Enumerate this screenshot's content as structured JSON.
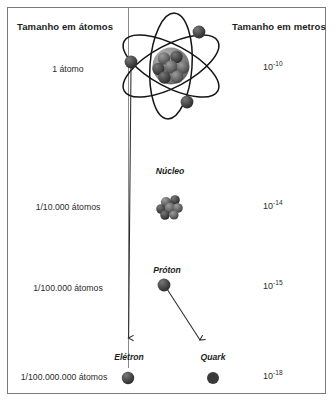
{
  "figure": {
    "title_left": "Tamanho em átomos",
    "title_right": "Tamanho em metros"
  },
  "rows": [
    {
      "atoms_label": "1 átomo",
      "meters_mantissa": "10",
      "meters_exponent": "-10",
      "part_label": "",
      "illustration": "atom-diagram"
    },
    {
      "atoms_label": "1/10.000 átomos",
      "meters_mantissa": "10",
      "meters_exponent": "-14",
      "part_label": "Núcleo",
      "illustration": "nucleus-cluster"
    },
    {
      "atoms_label": "1/100.000 átomos",
      "meters_mantissa": "10",
      "meters_exponent": "-15",
      "part_label": "Próton",
      "illustration": "proton-sphere"
    },
    {
      "atoms_label": "1/100.000.000 átomos",
      "meters_mantissa": "10",
      "meters_exponent": "-18",
      "part_label": "Elétron",
      "part_label_secondary": "Quark",
      "illustration": "electron-and-quark-spheres"
    }
  ],
  "icons": {
    "atom": "atom-icon",
    "nucleus": "nucleus-icon",
    "proton": "proton-icon",
    "electron": "electron-icon",
    "quark": "quark-icon",
    "electron_arrow": "electron-leader-arrow-icon",
    "quark_arrow": "quark-leader-arrow-icon"
  },
  "colors": {
    "frame": "#7b7b7b",
    "divider": "#8a8a8a",
    "text": "#2b2b2b",
    "heading": "#1d1d1d",
    "orbit": "#1b1b1b",
    "particle_dark": "#333333",
    "particle_light": "#8f8f8f",
    "nucleus_fill": "#8a8a8a"
  }
}
